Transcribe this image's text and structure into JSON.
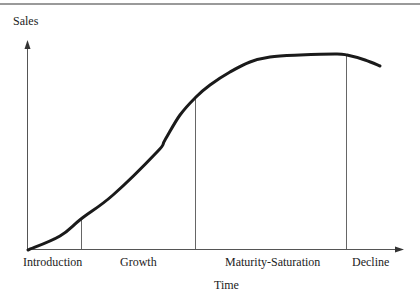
{
  "chart_data": {
    "type": "line",
    "title": "",
    "ylabel": "Sales",
    "xlabel": "Time",
    "stages": [
      "Introduction",
      "Growth",
      "Maturity-Saturation",
      "Decline"
    ],
    "stage_boundaries_x_px": [
      81,
      196,
      346
    ],
    "series": [
      {
        "name": "Sales",
        "points_px": [
          [
            28,
            250
          ],
          [
            60,
            236
          ],
          [
            81,
            219
          ],
          [
            113,
            195
          ],
          [
            157,
            152
          ],
          [
            165,
            140
          ],
          [
            180,
            115
          ],
          [
            196,
            97
          ],
          [
            210,
            85
          ],
          [
            230,
            72
          ],
          [
            250,
            62
          ],
          [
            270,
            57
          ],
          [
            300,
            55
          ],
          [
            335,
            54
          ],
          [
            347,
            55
          ],
          [
            365,
            60
          ],
          [
            380,
            66
          ]
        ]
      }
    ],
    "grid": false,
    "legend": "none",
    "ticks": false
  },
  "labels": {
    "y_axis": "Sales",
    "x_axis": "Time",
    "stage_introduction": "Introduction",
    "stage_growth": "Growth",
    "stage_maturity": "Maturity-Saturation",
    "stage_decline": "Decline"
  },
  "colors": {
    "curve": "#1a1a1a",
    "axis": "#555555",
    "rule": "#9a9a9a"
  }
}
